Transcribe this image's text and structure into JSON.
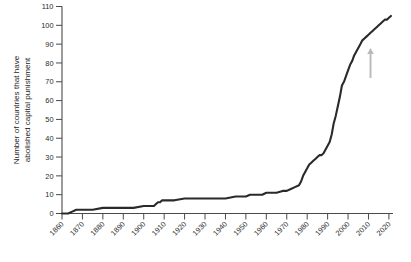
{
  "chart_data": {
    "type": "line",
    "title": "",
    "xlabel": "",
    "ylabel": "Number of countries that have abolished capital punishment",
    "ylabel_line1": "Number of countries that have",
    "ylabel_line2": "abolished capital punishment",
    "xlim": [
      1860,
      2022
    ],
    "ylim": [
      0,
      110
    ],
    "grid": false,
    "legend": null,
    "line_color": "#2a2a2a",
    "axis_color": "#4a4a4a",
    "background": "#ffffff",
    "x_tick_labels": [
      "1860",
      "1870",
      "1880",
      "1890",
      "1900",
      "1910",
      "1920",
      "1930",
      "1940",
      "1950",
      "1960",
      "1970",
      "1980",
      "1990",
      "2000",
      "2010",
      "2020"
    ],
    "x_ticks": [
      1860,
      1870,
      1880,
      1890,
      1900,
      1910,
      1920,
      1930,
      1940,
      1950,
      1960,
      1970,
      1980,
      1990,
      2000,
      2010,
      2020
    ],
    "y_tick_labels": [
      "0",
      "10",
      "20",
      "30",
      "40",
      "50",
      "60",
      "70",
      "80",
      "90",
      "100",
      "110"
    ],
    "y_ticks": [
      0,
      10,
      20,
      30,
      40,
      50,
      60,
      70,
      80,
      90,
      100,
      110
    ],
    "x": [
      1860,
      1863,
      1865,
      1867,
      1870,
      1875,
      1880,
      1885,
      1890,
      1895,
      1900,
      1903,
      1905,
      1906,
      1907,
      1908,
      1909,
      1910,
      1912,
      1915,
      1920,
      1925,
      1930,
      1935,
      1940,
      1945,
      1948,
      1950,
      1952,
      1955,
      1958,
      1960,
      1963,
      1965,
      1968,
      1970,
      1972,
      1974,
      1976,
      1977,
      1978,
      1979,
      1980,
      1981,
      1982,
      1983,
      1984,
      1985,
      1986,
      1987,
      1988,
      1989,
      1990,
      1991,
      1992,
      1993,
      1994,
      1995,
      1996,
      1997,
      1998,
      1999,
      2000,
      2001,
      2002,
      2003,
      2004,
      2005,
      2006,
      2007,
      2008,
      2009,
      2010,
      2011,
      2012,
      2013,
      2014,
      2015,
      2016,
      2017,
      2018,
      2019,
      2020,
      2021
    ],
    "y": [
      0,
      0,
      1,
      2,
      2,
      2,
      3,
      3,
      3,
      3,
      4,
      4,
      4,
      5,
      6,
      6,
      7,
      7,
      7,
      7,
      8,
      8,
      8,
      8,
      8,
      9,
      9,
      9,
      10,
      10,
      10,
      11,
      11,
      11,
      12,
      12,
      13,
      14,
      15,
      17,
      20,
      22,
      24,
      26,
      27,
      28,
      29,
      30,
      31,
      31,
      32,
      34,
      36,
      38,
      42,
      48,
      52,
      57,
      62,
      68,
      70,
      73,
      76,
      79,
      81,
      84,
      86,
      88,
      90,
      92,
      93,
      94,
      95,
      96,
      97,
      98,
      99,
      100,
      101,
      102,
      103,
      103,
      104,
      105
    ],
    "annotations": [
      {
        "name": "grey-up-arrow",
        "type": "arrow",
        "direction": "up",
        "color": "#b9b9b9",
        "x_value": 2011,
        "y_from": 72,
        "y_to": 88
      }
    ]
  }
}
